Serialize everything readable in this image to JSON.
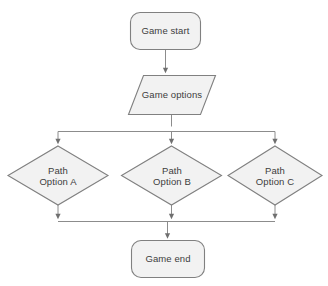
{
  "diagram": {
    "type": "flowchart",
    "orientation": "top-to-bottom",
    "background_color": "#ffffff",
    "shape_fill_color": "#f2f2f2",
    "shape_border_color": "#808080",
    "connector_color": "#8c8c8c",
    "text_color": "#3d3d3d",
    "nodes": [
      {
        "id": "game-start",
        "shape": "rounded-rectangle",
        "role": "terminator",
        "label": "Game start"
      },
      {
        "id": "game-options",
        "shape": "parallelogram",
        "role": "input-output",
        "label": "Game options"
      },
      {
        "id": "path-option-a",
        "shape": "diamond",
        "role": "decision",
        "label": "Path\nOption A"
      },
      {
        "id": "path-option-b",
        "shape": "diamond",
        "role": "decision",
        "label": "Path\nOption B"
      },
      {
        "id": "path-option-c",
        "shape": "diamond",
        "role": "decision",
        "label": "Path\nOption C"
      },
      {
        "id": "game-end",
        "shape": "rounded-rectangle",
        "role": "terminator",
        "label": "Game end"
      }
    ],
    "edges": [
      {
        "from": "game-start",
        "to": "game-options",
        "label": "",
        "arrow": "down"
      },
      {
        "from": "game-options",
        "to": "path-option-a",
        "label": "",
        "arrow": "down"
      },
      {
        "from": "game-options",
        "to": "path-option-b",
        "label": "",
        "arrow": "down"
      },
      {
        "from": "game-options",
        "to": "path-option-c",
        "label": "",
        "arrow": "down"
      },
      {
        "from": "path-option-a",
        "to": "game-end",
        "label": "",
        "arrow": "down"
      },
      {
        "from": "path-option-b",
        "to": "game-end",
        "label": "",
        "arrow": "down"
      },
      {
        "from": "path-option-c",
        "to": "game-end",
        "label": "",
        "arrow": "down"
      }
    ]
  }
}
